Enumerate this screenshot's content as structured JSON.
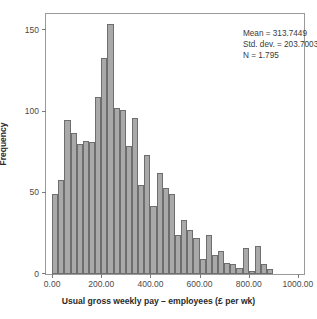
{
  "chart_data": {
    "type": "bar",
    "chart_subtype": "histogram",
    "title": "",
    "xlabel": "Usual gross weekly pay – employees (£ per wk)",
    "ylabel": "Frequency",
    "xlim": [
      -25,
      1025
    ],
    "ylim": [
      0,
      160
    ],
    "grid": false,
    "legend": null,
    "bin_width": 25,
    "bar_color": "#a9a9a9",
    "bar_edge_color": "#6e6e6e",
    "x_ticks": [
      0,
      200,
      400,
      600,
      800,
      1000
    ],
    "x_tick_labels": [
      "0.00",
      "200.00",
      "400.00",
      "600.00",
      "800.00",
      "1000.00"
    ],
    "y_ticks": [
      0,
      50,
      100,
      150
    ],
    "y_tick_labels": [
      "0",
      "50",
      "100",
      "150"
    ],
    "bin_starts": [
      0,
      25,
      50,
      75,
      100,
      125,
      150,
      175,
      200,
      225,
      250,
      275,
      300,
      325,
      350,
      375,
      400,
      425,
      450,
      475,
      500,
      525,
      550,
      575,
      600,
      625,
      650,
      675,
      700,
      725,
      750,
      775,
      800,
      825,
      850,
      875,
      900,
      925,
      950,
      975
    ],
    "categories": [
      "0-25",
      "25-50",
      "50-75",
      "75-100",
      "100-125",
      "125-150",
      "150-175",
      "175-200",
      "200-225",
      "225-250",
      "250-275",
      "275-300",
      "300-325",
      "325-350",
      "350-375",
      "375-400",
      "400-425",
      "425-450",
      "450-475",
      "475-500",
      "500-525",
      "525-550",
      "550-575",
      "575-600",
      "600-625",
      "625-650",
      "650-675",
      "675-700",
      "700-725",
      "725-750",
      "750-775",
      "775-800",
      "800-825",
      "825-850",
      "850-875",
      "875-900",
      "900-925",
      "925-950",
      "950-975",
      "975-1000"
    ],
    "values": [
      49,
      58,
      95,
      87,
      80,
      82,
      81,
      109,
      133,
      154,
      102,
      101,
      79,
      96,
      55,
      73,
      42,
      62,
      53,
      49,
      24,
      33,
      27,
      22,
      9,
      24,
      12,
      14,
      7,
      6,
      4,
      16,
      2,
      17,
      6,
      3,
      0,
      0,
      0,
      0
    ],
    "values_note": "Bar heights read off the y-axis (Frequency); bins of width 25 spanning 0 to 1000."
  },
  "annotation": {
    "mean_line": "Mean = 313.7449",
    "stddev_line": "Std. dev. = 203.70031",
    "n_line": "N = 1.795"
  },
  "axes": {
    "y_title": "Frequency",
    "x_title": "Usual gross weekly pay – employees (£ per wk)"
  }
}
